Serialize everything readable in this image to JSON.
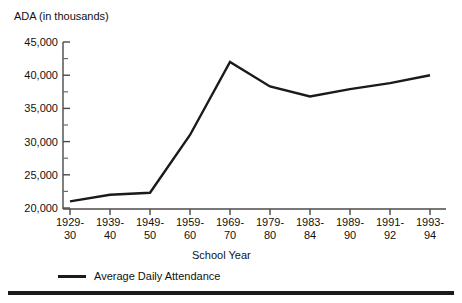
{
  "chart_data": {
    "type": "line",
    "title": "",
    "ylabel": "ADA (in thousands)",
    "xlabel": "School Year",
    "categories": [
      "1929-30",
      "1939-40",
      "1949-50",
      "1959-60",
      "1969-70",
      "1979-80",
      "1983-84",
      "1989-90",
      "1991-92",
      "1993-94"
    ],
    "category_lines": [
      [
        "1929-",
        "30"
      ],
      [
        "1939-",
        "40"
      ],
      [
        "1949-",
        "50"
      ],
      [
        "1959-",
        "60"
      ],
      [
        "1969-",
        "70"
      ],
      [
        "1979-",
        "80"
      ],
      [
        "1983-",
        "84"
      ],
      [
        "1989-",
        "90"
      ],
      [
        "1991-",
        "92"
      ],
      [
        "1993-",
        "94"
      ]
    ],
    "series": [
      {
        "name": "Average Daily Attendance",
        "values": [
          21000,
          22000,
          22300,
          31000,
          42000,
          38300,
          36800,
          37900,
          38800,
          40000
        ],
        "color": "#1a1a1a"
      }
    ],
    "ylim": [
      20000,
      45000
    ],
    "y_ticks": [
      20000,
      25000,
      30000,
      35000,
      40000,
      45000
    ],
    "y_tick_labels": [
      "20,000",
      "25,000",
      "30,000",
      "35,000",
      "40,000",
      "45,000"
    ],
    "y_minor_tick_interval": 2500,
    "grid": false,
    "legend": {
      "position": "bottom-left",
      "entries": [
        "Average Daily Attendance"
      ]
    }
  },
  "legend": {
    "entry_label": "Average Daily Attendance"
  }
}
